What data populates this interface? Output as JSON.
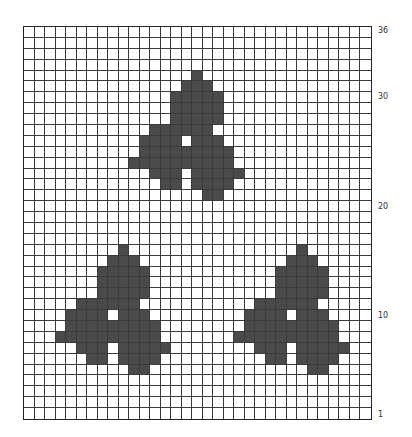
{
  "chart_data": {
    "type": "heatmap",
    "title": "",
    "columns": 33,
    "rows": 36,
    "row_numbering": "bottom-to-top, 1 at bottom, 36 at top",
    "row_labels": [
      {
        "text": "36",
        "row": 36
      },
      {
        "text": "30",
        "row": 30
      },
      {
        "text": "20",
        "row": 20
      },
      {
        "text": "10",
        "row": 10
      },
      {
        "text": "1",
        "row": 1
      }
    ],
    "colors": {
      "filled": "#4a4a4a",
      "empty": "#ffffff",
      "grid": "#3a3a3a"
    },
    "motif_template": {
      "note": "row offsets from motif top (0) and column offsets from motif anchor column (0 = stem top column)",
      "rows": [
        {
          "dr": 0,
          "spans": [
            [
              0,
              0
            ]
          ]
        },
        {
          "dr": 1,
          "spans": [
            [
              -1,
              1
            ]
          ]
        },
        {
          "dr": 2,
          "spans": [
            [
              -2,
              2
            ]
          ]
        },
        {
          "dr": 3,
          "spans": [
            [
              -2,
              2
            ]
          ]
        },
        {
          "dr": 4,
          "spans": [
            [
              -2,
              2
            ]
          ]
        },
        {
          "dr": 5,
          "spans": [
            [
              -4,
              1
            ]
          ]
        },
        {
          "dr": 6,
          "spans": [
            [
              -5,
              -2
            ],
            [
              0,
              2
            ]
          ]
        },
        {
          "dr": 7,
          "spans": [
            [
              -5,
              3
            ]
          ]
        },
        {
          "dr": 8,
          "spans": [
            [
              -6,
              3
            ]
          ]
        },
        {
          "dr": 9,
          "spans": [
            [
              -4,
              -2
            ],
            [
              0,
              4
            ]
          ]
        },
        {
          "dr": 10,
          "spans": [
            [
              -3,
              -2
            ],
            [
              0,
              3
            ]
          ]
        },
        {
          "dr": 11,
          "spans": [
            [
              1,
              2
            ]
          ]
        }
      ]
    },
    "motifs": [
      {
        "name": "top-motif",
        "top_row_index": 4,
        "anchor_col": 16
      },
      {
        "name": "bottom-left-motif",
        "top_row_index": 20,
        "anchor_col": 9
      },
      {
        "name": "bottom-right-motif",
        "top_row_index": 20,
        "anchor_col": 26
      }
    ]
  }
}
